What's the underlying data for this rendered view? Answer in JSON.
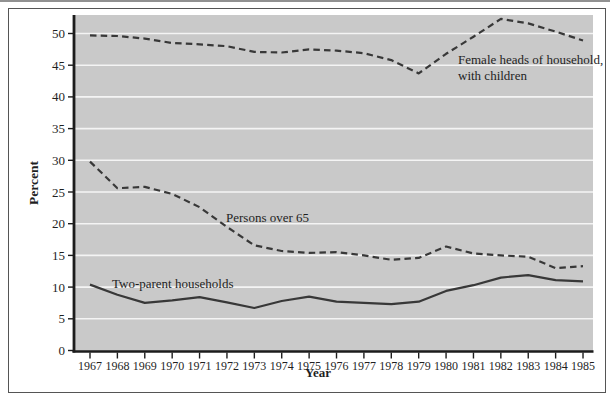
{
  "chart_data": {
    "type": "line",
    "title": "",
    "xlabel": "Year",
    "ylabel": "Percent",
    "x": [
      1967,
      1968,
      1969,
      1970,
      1971,
      1972,
      1973,
      1974,
      1975,
      1976,
      1977,
      1978,
      1979,
      1980,
      1981,
      1982,
      1983,
      1984,
      1985
    ],
    "yticks": [
      0,
      5,
      10,
      15,
      20,
      25,
      30,
      35,
      40,
      45,
      50
    ],
    "ylim": [
      0,
      52.9
    ],
    "grid": "horizontal-white-on-gray",
    "legend_position": "inline-annotations",
    "series": [
      {
        "name": "Female heads of household, with children",
        "line_style": "dashed",
        "values": [
          49.7,
          49.6,
          49.2,
          48.5,
          48.3,
          48.0,
          47.1,
          47.0,
          47.5,
          47.3,
          46.9,
          45.8,
          43.7,
          46.8,
          49.5,
          52.3,
          51.6,
          50.3,
          48.9
        ]
      },
      {
        "name": "Persons over 65",
        "line_style": "dashed",
        "values": [
          29.8,
          25.6,
          25.8,
          24.7,
          22.6,
          19.5,
          16.6,
          15.7,
          15.4,
          15.5,
          15.0,
          14.3,
          14.6,
          16.4,
          15.3,
          15.0,
          14.8,
          13.0,
          13.3
        ]
      },
      {
        "name": "Two-parent households",
        "line_style": "solid",
        "values": [
          10.4,
          8.8,
          7.5,
          7.9,
          8.4,
          7.6,
          6.7,
          7.8,
          8.5,
          7.7,
          7.5,
          7.3,
          7.7,
          9.4,
          10.3,
          11.5,
          11.9,
          11.1,
          10.9
        ]
      }
    ],
    "annotations": [
      {
        "lines": [
          "Female heads of household,",
          "with children"
        ],
        "x": 458,
        "y": 64,
        "line_height": 16
      },
      {
        "lines": [
          "Persons over 65"
        ],
        "x": 226,
        "y": 222,
        "line_height": 16
      },
      {
        "lines": [
          "Two-parent households"
        ],
        "x": 112,
        "y": 288,
        "line_height": 16
      }
    ],
    "colors": {
      "plot_background": "#c9c9c9",
      "gridline": "#f4f4f4",
      "line": "#383838",
      "text": "#1f1f1f",
      "frame_border": "#555555"
    }
  }
}
